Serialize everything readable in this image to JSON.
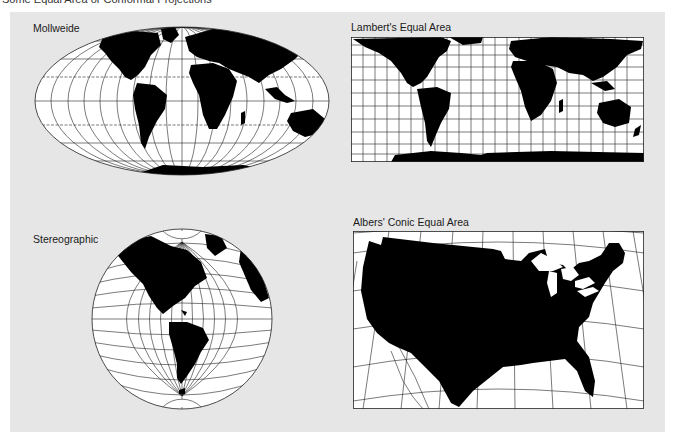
{
  "page": {
    "caption": "Some Equal Area or Conformal Projections"
  },
  "colors": {
    "panel": "#e6e6e6",
    "land": "#000000",
    "ocean": "#ffffff",
    "graticule": "#222222"
  },
  "projections": [
    {
      "id": "mollweide",
      "label": "Mollweide",
      "region": "World"
    },
    {
      "id": "lambert",
      "label": "Lambert's Equal Area",
      "region": "World"
    },
    {
      "id": "stereographic",
      "label": "Stereographic",
      "region": "Western Hemisphere"
    },
    {
      "id": "albers",
      "label": "Albers' Conic Equal Area",
      "region": "Contiguous United States"
    }
  ]
}
